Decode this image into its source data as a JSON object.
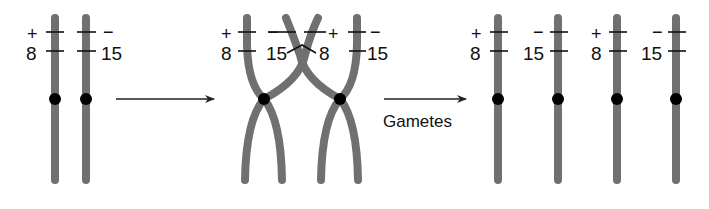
{
  "diagram": {
    "colors": {
      "chromosome": "#707070",
      "centromere": "#000000",
      "arrow": "#222222",
      "text": "#111111",
      "background": "#ffffff"
    },
    "stage1": {
      "name": "homologous-pair",
      "chromosomes": [
        {
          "sign": "+",
          "locus": "8"
        },
        {
          "sign": "−",
          "locus": "15"
        }
      ]
    },
    "arrow1": {
      "label": ""
    },
    "stage2": {
      "name": "crossing-over",
      "labels": [
        {
          "sign": "+",
          "locus": "8"
        },
        {
          "sign": "−",
          "locus": "15"
        },
        {
          "sign": "+",
          "locus": "8"
        },
        {
          "sign": "−",
          "locus": "15"
        }
      ]
    },
    "arrow2": {
      "label": "Gametes"
    },
    "stage3": {
      "name": "gametes",
      "chromosomes": [
        {
          "sign": "+",
          "locus": "8"
        },
        {
          "sign": "−",
          "locus": "15"
        },
        {
          "sign": "+",
          "locus": "8"
        },
        {
          "sign": "−",
          "locus": "15"
        }
      ]
    }
  }
}
